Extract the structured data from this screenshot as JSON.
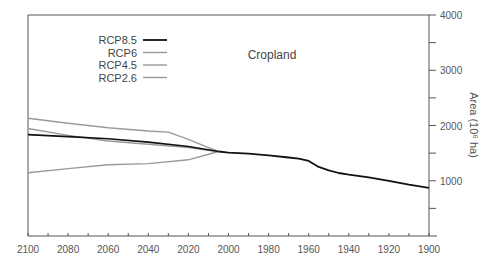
{
  "chart_data": {
    "type": "line",
    "title": "Cropland",
    "xlabel": "",
    "ylabel": "Area (10^6 ha)",
    "ylabel_display": "Area (10⁶ ha)",
    "xlim": [
      2100,
      1900
    ],
    "x_reversed": true,
    "ylim": [
      0,
      4000
    ],
    "x_ticks": [
      2100,
      2080,
      2060,
      2040,
      2020,
      2000,
      1980,
      1960,
      1940,
      1920,
      1900
    ],
    "y_ticks": [
      1000,
      2000,
      3000,
      4000
    ],
    "y_axis_position": "right",
    "grid": false,
    "legend_position": "upper-left",
    "legend": [
      "RCP8.5",
      "RCP6",
      "RCP4.5",
      "RCP2.6"
    ],
    "historical": {
      "name": "Historical",
      "color": "#111111",
      "x": [
        1900,
        1910,
        1920,
        1930,
        1940,
        1945,
        1950,
        1955,
        1960,
        1965,
        1970,
        1980,
        1990,
        2000,
        2005
      ],
      "values": [
        870,
        930,
        1000,
        1060,
        1110,
        1140,
        1190,
        1250,
        1360,
        1400,
        1420,
        1460,
        1490,
        1510,
        1530
      ]
    },
    "series": [
      {
        "name": "RCP8.5",
        "color": "#111111",
        "x": [
          2005,
          2020,
          2040,
          2060,
          2080,
          2100
        ],
        "values": [
          1530,
          1620,
          1700,
          1760,
          1800,
          1835
        ]
      },
      {
        "name": "RCP6",
        "color": "#999999",
        "x": [
          2005,
          2010,
          2020,
          2040,
          2060,
          2080,
          2100
        ],
        "values": [
          1530,
          1550,
          1600,
          1660,
          1720,
          1820,
          1945
        ]
      },
      {
        "name": "RCP4.5",
        "color": "#999999",
        "x": [
          2005,
          2010,
          2020,
          2030,
          2040,
          2060,
          2080,
          2100
        ],
        "values": [
          1530,
          1600,
          1750,
          1880,
          1900,
          1960,
          2040,
          2130
        ]
      },
      {
        "name": "RCP2.6",
        "color": "#999999",
        "x": [
          2005,
          2010,
          2020,
          2040,
          2060,
          2080,
          2100
        ],
        "values": [
          1530,
          1480,
          1380,
          1310,
          1290,
          1220,
          1145
        ]
      }
    ]
  }
}
